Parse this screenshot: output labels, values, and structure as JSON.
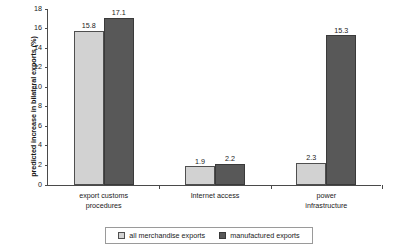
{
  "chart_data": {
    "type": "bar",
    "title": "",
    "xlabel": "",
    "ylabel": "predicted increase in bilateral exports (%)",
    "categories": [
      "export customs procedures",
      "Internet access",
      "power infrastructure"
    ],
    "series": [
      {
        "name": "all merchandise exports",
        "values": [
          15.8,
          1.9,
          2.3
        ],
        "color": "#d2d2d2"
      },
      {
        "name": "manufactured exports",
        "values": [
          17.1,
          2.2,
          15.3
        ],
        "color": "#585858"
      }
    ],
    "ylim": [
      0,
      18
    ],
    "yticks": [
      0,
      2,
      4,
      6,
      8,
      10,
      12,
      14,
      16,
      18
    ],
    "ytick_labels": [
      "0",
      "2",
      "4",
      "6",
      "8",
      "10",
      "12",
      "14",
      "16",
      "18"
    ],
    "grid": false,
    "legend_position": "bottom",
    "value_labels": [
      [
        "15.8",
        "17.1"
      ],
      [
        "1.9",
        "2.2"
      ],
      [
        "2.3",
        "15.3"
      ]
    ],
    "category_lines": [
      [
        "export customs",
        "procedures"
      ],
      [
        "Internet access"
      ],
      [
        "power",
        "infrastructure"
      ]
    ]
  },
  "legend": {
    "items": [
      {
        "label": "all merchandise exports",
        "swatch": "light-swatch-icon"
      },
      {
        "label": "manufactured exports",
        "swatch": "dark-swatch-icon"
      }
    ]
  }
}
